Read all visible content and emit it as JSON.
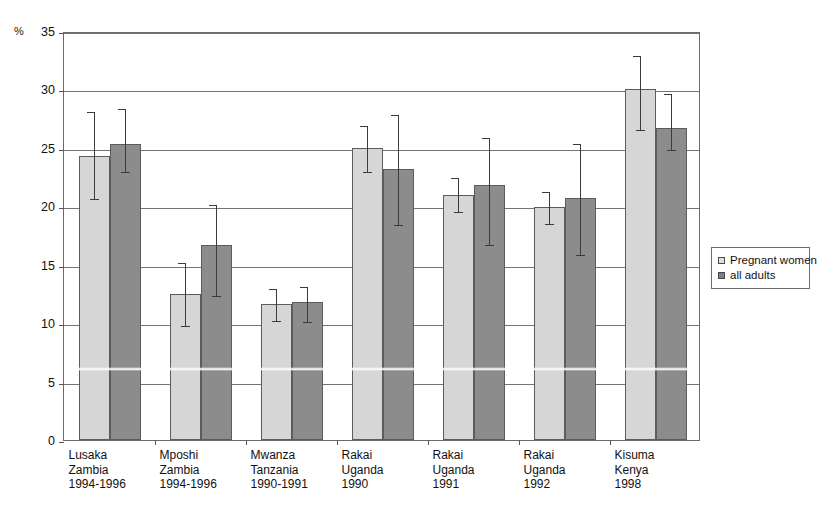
{
  "chart_data": {
    "type": "bar",
    "title": "",
    "subtitle": "",
    "xlabel": "",
    "ylabel": "%",
    "ylim": [
      0,
      35
    ],
    "yticks": [
      0,
      5,
      10,
      15,
      20,
      25,
      30,
      35
    ],
    "grid": true,
    "legend_position": "right",
    "error_bars": true,
    "categories": [
      "Lusaka\nZambia\n1994-1996",
      "Mposhi\nZambia\n1994-1996",
      "Mwanza\nTanzania\n1990-1991",
      "Rakai\nUganda\n1990",
      "Rakai\nUganda\n1991",
      "Rakai\nUganda\n1992",
      "Kisuma\nKenya\n1998"
    ],
    "category_lines": [
      [
        "Lusaka",
        "Zambia",
        "1994-1996"
      ],
      [
        "Mposhi",
        "Zambia",
        "1994-1996"
      ],
      [
        "Mwanza",
        "Tanzania",
        "1990-1991"
      ],
      [
        "Rakai",
        "Uganda",
        "1990"
      ],
      [
        "Rakai",
        "Uganda",
        "1991"
      ],
      [
        "Rakai",
        "Uganda",
        "1992"
      ],
      [
        "Kisuma",
        "Kenya",
        "1998"
      ]
    ],
    "series": [
      {
        "name": "Pregnant women",
        "color": "#d6d6d6",
        "values": [
          24.3,
          12.5,
          11.6,
          25.0,
          21.0,
          19.9,
          30.0
        ],
        "ci_low": [
          20.7,
          9.8,
          10.3,
          23.0,
          19.6,
          18.6,
          26.6
        ],
        "ci_high": [
          28.2,
          15.3,
          13.1,
          27.0,
          22.6,
          21.4,
          33.0
        ]
      },
      {
        "name": "all adults",
        "color": "#8c8c8c",
        "values": [
          25.3,
          16.7,
          11.8,
          23.2,
          21.8,
          20.7,
          26.7
        ],
        "ci_low": [
          23.0,
          12.4,
          10.2,
          18.5,
          16.8,
          15.9,
          24.9
        ],
        "ci_high": [
          28.5,
          20.3,
          13.3,
          28.0,
          26.0,
          25.5,
          29.8
        ]
      }
    ]
  },
  "legend": {
    "items": [
      {
        "label": "Pregnant women",
        "swatch": "light"
      },
      {
        "label": "all adults",
        "swatch": "dark"
      }
    ]
  },
  "axis": {
    "unit_label": "%"
  }
}
